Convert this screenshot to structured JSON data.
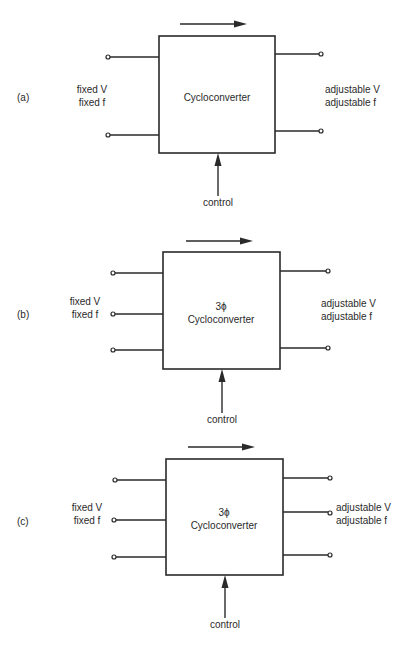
{
  "figure": {
    "panels": [
      {
        "id": "a",
        "label": "(a)",
        "block_title": "",
        "block_name": "Cycloconverter",
        "input_label_1": "fixed V",
        "input_label_2": "fixed f",
        "output_label_1": "adjustable V",
        "output_label_2": "adjustable f",
        "control_label": "control",
        "input_terminals": 2,
        "output_terminals": 2
      },
      {
        "id": "b",
        "label": "(b)",
        "block_title": "3ϕ",
        "block_name": "Cycloconverter",
        "input_label_1": "fixed V",
        "input_label_2": "fixed f",
        "output_label_1": "adjustable V",
        "output_label_2": "adjustable f",
        "control_label": "control",
        "input_terminals": 3,
        "output_terminals": 2
      },
      {
        "id": "c",
        "label": "(c)",
        "block_title": "3ϕ",
        "block_name": "Cycloconverter",
        "input_label_1": "fixed V",
        "input_label_2": "fixed f",
        "output_label_1": "adjustable V",
        "output_label_2": "adjustable f",
        "control_label": "control",
        "input_terminals": 3,
        "output_terminals": 3
      }
    ],
    "colors": {
      "ink": "#2a2a2a",
      "background": "#ffffff"
    }
  }
}
